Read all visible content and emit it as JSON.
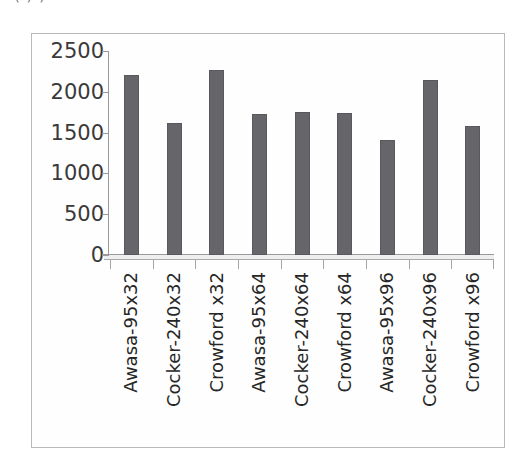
{
  "caption_fragment": "(    )       )",
  "colors": {
    "bar_fill": "#66656a",
    "axis_line": "#9a9a9a",
    "frame_border": "#b9b9b9",
    "tick_label": "#3a3a3a",
    "category_label": "#262626",
    "background": "#ffffff"
  },
  "chart_data": {
    "type": "bar",
    "title": "",
    "xlabel": "",
    "ylabel": "",
    "ylim": [
      0,
      2500
    ],
    "yticks": [
      0,
      500,
      1000,
      1500,
      2000,
      2500
    ],
    "ytick_labels": [
      "0",
      "500",
      "1000",
      "1500",
      "2000",
      "2500"
    ],
    "grid": false,
    "legend": false,
    "legend_position": "none",
    "categories": [
      "Awasa-95x32",
      "Cocker-240x32",
      "Crowford x32",
      "Awasa-95x64",
      "Cocker-240x64",
      "Crowford x64",
      "Awasa-95x96",
      "Cocker-240x96",
      "Crowford x96"
    ],
    "values": [
      2200,
      1620,
      2265,
      1730,
      1755,
      1745,
      1410,
      2140,
      1585
    ]
  }
}
